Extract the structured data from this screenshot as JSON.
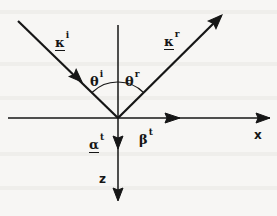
{
  "figure": {
    "background_color": "#f7f6f4",
    "ink_color": "#161616",
    "width": 277,
    "height": 216,
    "origin": {
      "x": 118,
      "y": 118
    }
  },
  "labels": {
    "k_incident": {
      "base": "κ",
      "sup": "i",
      "underlined": true,
      "x": 55,
      "y": 37
    },
    "k_reflected": {
      "base": "κ",
      "sup": "r",
      "underlined": true,
      "x": 165,
      "y": 36
    },
    "theta_incident": {
      "base": "θ",
      "sup": "i",
      "underlined": false,
      "x": 91,
      "y": 76
    },
    "theta_reflected": {
      "base": "θ",
      "sup": "r",
      "underlined": false,
      "x": 126,
      "y": 76
    },
    "alpha_transmitted": {
      "base": "α",
      "sup": "t",
      "underlined": true,
      "x": 90,
      "y": 138
    },
    "beta_transmitted": {
      "base": "β",
      "sup": "t",
      "underlined": false,
      "x": 140,
      "y": 134
    },
    "axis_x": {
      "base": "x",
      "sup": "",
      "underlined": false,
      "x": 255,
      "y": 131
    },
    "axis_z": {
      "base": "z",
      "sup": "",
      "underlined": false,
      "x": 100,
      "y": 174
    }
  },
  "geometry": {
    "x_axis": {
      "x1": 8,
      "y1": 118,
      "x2": 270,
      "y2": 118
    },
    "normal_up": {
      "x1": 118,
      "y1": 25,
      "x2": 118,
      "y2": 118
    },
    "z_axis_down": {
      "x1": 118,
      "y1": 118,
      "x2": 118,
      "y2": 200
    },
    "incident_ray": {
      "x1": 18,
      "y1": 21,
      "x2": 118,
      "y2": 118
    },
    "reflected_ray": {
      "x1": 118,
      "y1": 118,
      "x2": 223,
      "y2": 14
    },
    "arc_incident": {
      "radius": 36,
      "from_deg": 224,
      "to_deg": 270
    },
    "arc_reflected": {
      "radius": 36,
      "from_deg": 270,
      "to_deg": 315
    },
    "arrowheads": [
      {
        "name": "incident-ray-arrowhead",
        "x": 80,
        "y": 80,
        "angle_deg": 44
      },
      {
        "name": "reflected-ray-arrowhead",
        "x": 223,
        "y": 14,
        "angle_deg": -45
      },
      {
        "name": "x-axis-mid-arrowhead",
        "x": 180,
        "y": 118,
        "angle_deg": 0
      },
      {
        "name": "x-axis-end-arrowhead",
        "x": 270,
        "y": 118,
        "angle_deg": 0
      },
      {
        "name": "z-axis-upper-arrowhead",
        "x": 118,
        "y": 148,
        "angle_deg": 90
      },
      {
        "name": "z-axis-end-arrowhead",
        "x": 118,
        "y": 200,
        "angle_deg": 90
      }
    ]
  }
}
